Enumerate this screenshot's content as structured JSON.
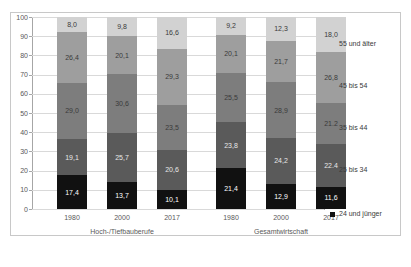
{
  "top_caption": "",
  "chart_data": {
    "type": "bar",
    "subtype": "stacked-percent",
    "title": "",
    "xlabel": "",
    "ylabel": "",
    "ylim": [
      0,
      100
    ],
    "ytick_step": 10,
    "yticks": [
      "0",
      "10",
      "20",
      "30",
      "40",
      "50",
      "60",
      "70",
      "80",
      "90",
      "100"
    ],
    "grid": true,
    "legend_position": "right",
    "categories": [
      "1980",
      "2000",
      "2017",
      "1980",
      "2000",
      "2017"
    ],
    "groups": [
      {
        "label": "Hoch-/Tiefbauberufe",
        "categories": [
          "1980",
          "2000",
          "2017"
        ]
      },
      {
        "label": "Gesamtwirtschaft",
        "categories": [
          "1980",
          "2000",
          "2017"
        ]
      }
    ],
    "series": [
      {
        "name": "24 und jünger",
        "color": "#111111",
        "label_color": "#ffffff",
        "values": [
          17.4,
          13.7,
          10.1,
          21.4,
          12.9,
          11.6
        ],
        "value_labels": [
          "17,4",
          "13,7",
          "10,1",
          "21,4",
          "12,9",
          "11,6"
        ]
      },
      {
        "name": "25 bis 34",
        "color": "#5a5a5a",
        "label_color": "#e8e8e8",
        "values": [
          19.1,
          25.7,
          20.6,
          23.8,
          24.2,
          22.4
        ],
        "value_labels": [
          "19,1",
          "25,7",
          "20,6",
          "23,8",
          "24,2",
          "22,4"
        ]
      },
      {
        "name": "35 bis 44",
        "color": "#7d7d7d",
        "label_color": "#3a3a3a",
        "values": [
          29.0,
          30.6,
          23.5,
          25.5,
          28.9,
          21.2
        ],
        "value_labels": [
          "29,0",
          "30,6",
          "23,5",
          "25,5",
          "28,9",
          "21,2"
        ]
      },
      {
        "name": "45 bis 54",
        "color": "#9e9e9e",
        "label_color": "#3a3a3a",
        "values": [
          26.4,
          20.1,
          29.3,
          20.1,
          21.7,
          26.8
        ],
        "value_labels": [
          "26,4",
          "20,1",
          "29,3",
          "20,1",
          "21,7",
          "26,8"
        ]
      },
      {
        "name": "55 und älter",
        "color": "#d2d2d2",
        "label_color": "#3a3a3a",
        "values": [
          8.0,
          9.8,
          16.6,
          9.2,
          12.3,
          18.0
        ],
        "value_labels": [
          "8,0",
          "9,8",
          "16,6",
          "9,2",
          "12,3",
          "18,0"
        ]
      }
    ],
    "legend_entries": [
      {
        "label": "55 und älter",
        "color": "#d2d2d2"
      },
      {
        "label": "45 bis 54",
        "color": "#9e9e9e"
      },
      {
        "label": "35 bis 44",
        "color": "#7d7d7d"
      },
      {
        "label": "25 bis 34",
        "color": "#5a5a5a"
      },
      {
        "label": "24 und jünger",
        "color": "#111111"
      }
    ]
  }
}
